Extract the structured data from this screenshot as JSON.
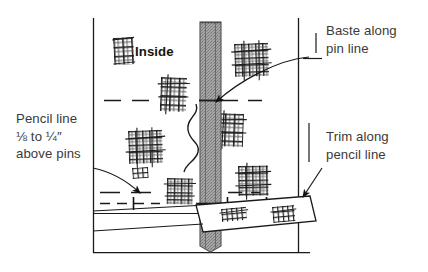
{
  "figure": {
    "background_color": "#ffffff",
    "line_color": "#1a1a1a",
    "text_color": "#3a3a3a",
    "strip_fill": "#9a9a9a",
    "strip_edge": "#6f6f6f"
  },
  "labels": {
    "inside": "Inside",
    "baste_along_pin_line": "Baste along\npin line",
    "trim_along_pencil_line": "Trim along\npencil line",
    "pencil_line_above_pins": "Pencil line\n⅛ to ¼″\nabove pins"
  },
  "diagram_elements": {
    "vertical_strip_name": "fabric-strip",
    "plaid_swatch_name": "plaid-swatch",
    "pin_name": "pin-mark",
    "pencil_line_name": "dashed-pencil-line",
    "baste_thread_name": "basting-thread",
    "trimmed_strip_name": "trimmed-off-strip"
  }
}
